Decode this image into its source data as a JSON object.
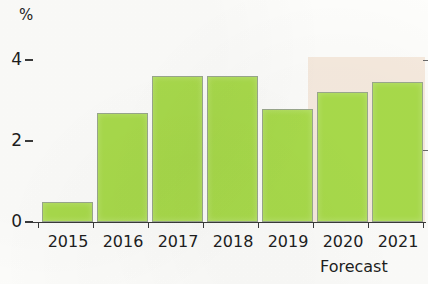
{
  "chart_data": {
    "type": "bar",
    "title": "",
    "subtitle": "",
    "xlabel": "",
    "ylabel": "%",
    "categories": [
      "2015",
      "2016",
      "2017",
      "2018",
      "2019",
      "2020",
      "2021"
    ],
    "values": [
      0.5,
      2.7,
      3.6,
      3.6,
      2.8,
      3.2,
      3.45
    ],
    "series": [
      {
        "name": "Growth",
        "values": [
          0.5,
          2.7,
          3.6,
          3.6,
          2.8,
          3.2,
          3.45
        ]
      }
    ],
    "ylim": [
      0,
      4.2
    ],
    "y_ticks": [
      "0",
      "2",
      "4"
    ],
    "y_tick_values": [
      0,
      2,
      4
    ],
    "grid": false,
    "legend": "none",
    "annotations": [
      {
        "text": "Forecast",
        "covers": [
          "2020",
          "2021"
        ],
        "position": "below-axis-right"
      }
    ],
    "bar_color": "#a9db4b",
    "bar_border_color": "#9aa88d",
    "forecast_band_color": "#f6eade",
    "axis_color": "#3a3a3a",
    "text_color": "#1e1e1e"
  },
  "axis": {
    "unit_label": "%",
    "y_labels": [
      "4",
      "2",
      "0"
    ],
    "x_labels": [
      "2015",
      "2016",
      "2017",
      "2018",
      "2019",
      "2020",
      "2021"
    ]
  },
  "footnote": {
    "forecast_label": "Forecast"
  }
}
